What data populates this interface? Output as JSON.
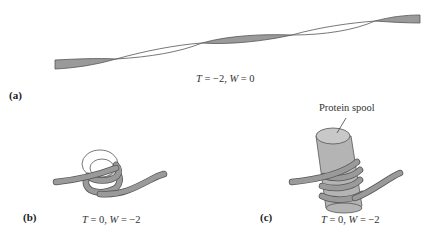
{
  "figure": {
    "panels": [
      {
        "id": "a",
        "label": "(a)",
        "caption_T": "T",
        "caption_rest_1": " = −2, ",
        "caption_W": "W",
        "caption_rest_2": " = 0",
        "description": "Twisted ribbon with two crossings (twist only)"
      },
      {
        "id": "b",
        "label": "(b)",
        "caption_T": "T",
        "caption_rest_1": " = 0, ",
        "caption_W": "W",
        "caption_rest_2": " = −2",
        "description": "Ribbon coiled into two loops (writhe only)"
      },
      {
        "id": "c",
        "label": "(c)",
        "caption_T": "T",
        "caption_rest_1": " = 0, ",
        "caption_W": "W",
        "caption_rest_2": " = −2",
        "description": "Ribbon wrapped twice around a protein spool",
        "callout": "Protein spool"
      }
    ],
    "colors": {
      "ribbon_fill": "#9a9a9a",
      "ribbon_stroke": "#555555",
      "spool_fill": "#b4b4b4",
      "spool_top": "#c8c8c8",
      "line": "#444444"
    }
  }
}
